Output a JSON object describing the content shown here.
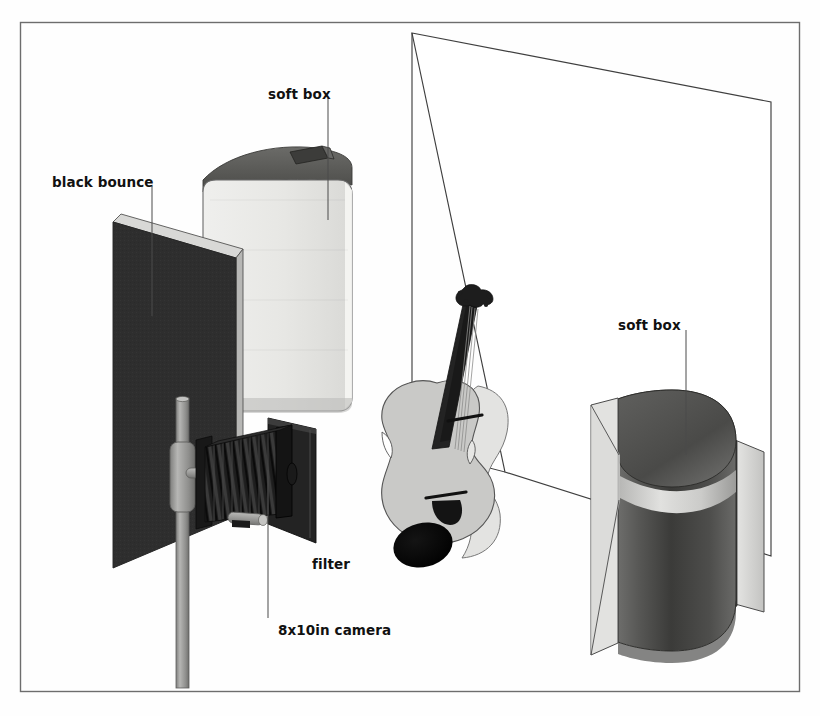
{
  "figure": {
    "kind": "lighting-setup-diagram",
    "background_color": "#fefefe",
    "frame_color": "#6d6d6d"
  },
  "labels": [
    {
      "id": "soft-box-left",
      "text": "soft box",
      "x": 268,
      "y": 86,
      "leader": {
        "x1": 328,
        "y1": 98,
        "x2": 328,
        "y2": 220
      }
    },
    {
      "id": "black-bounce",
      "text": "black bounce",
      "x": 52,
      "y": 174,
      "leader": {
        "x1": 152,
        "y1": 186,
        "x2": 152,
        "y2": 316
      }
    },
    {
      "id": "soft-box-right",
      "text": "soft box",
      "x": 618,
      "y": 317,
      "leader": {
        "x1": 686,
        "y1": 330,
        "x2": 686,
        "y2": 455
      }
    },
    {
      "id": "filter",
      "text": "filter",
      "x": 312,
      "y": 556,
      "leader": {
        "x1": 310,
        "y1": 538,
        "x2": 310,
        "y2": 430
      }
    },
    {
      "id": "camera",
      "text": "8x10in camera",
      "x": 278,
      "y": 622,
      "leader": {
        "x1": 268,
        "y1": 618,
        "x2": 268,
        "y2": 470
      }
    }
  ],
  "elements": {
    "frame": {
      "name": "diagram-frame",
      "x": 20,
      "y": 22,
      "w": 780,
      "h": 670
    },
    "backdrop": {
      "name": "white-backdrop",
      "note": "large white sweep panel, outline only"
    },
    "softbox_left": {
      "name": "soft-box-left",
      "note": "bright white rounded rectangular softbox, dark top"
    },
    "softbox_right": {
      "name": "soft-box-right",
      "note": "dark cylindrical softbox seen from behind"
    },
    "bounce": {
      "name": "black-bounce-panel",
      "note": "black flag panel on stand"
    },
    "camera": {
      "name": "large-format-camera",
      "note": "8x10 inch bellows view camera on stand"
    },
    "filter": {
      "name": "filter-panel",
      "note": "dark rectangular filter in front of lens"
    },
    "violin": {
      "name": "violin-subject",
      "note": "violin lying on the backdrop"
    },
    "stand": {
      "name": "light-stand-post",
      "note": "grey vertical stand column"
    }
  },
  "palette": {
    "ink": "#111111",
    "outline": "#4a4a4a",
    "softbox_face": "#e8e8e6",
    "softbox_top": "#585856",
    "bounce_black": "#2e2e2e",
    "bounce_edge": "#cfcfcd",
    "cyl_dark": "#4b4b4b",
    "cyl_darker": "#2c2c2c",
    "cyl_light": "#d8d8d6",
    "stand_grey": "#9b9b99",
    "violin_body": "#c9c9c7",
    "violin_neck": "#232323"
  }
}
